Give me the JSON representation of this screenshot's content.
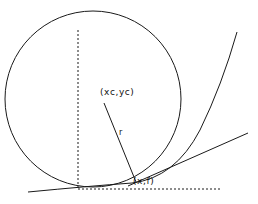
{
  "figure": {
    "type": "geometry-diagram",
    "background_color": "#ffffff",
    "stroke_color": "#1a1a1a",
    "labels": {
      "center_point": "(xc,yc)",
      "tangent_point": "(x,f)",
      "radius": "r"
    },
    "geometry": {
      "circle": {
        "center_x": 93,
        "center_y": 99,
        "radius": 88,
        "style": "solid"
      },
      "vertical_dashed_line": {
        "x": 78,
        "y_start": 30,
        "y_end": 188,
        "style": "dashed"
      },
      "horizontal_dashed_line": {
        "y": 189,
        "x_start": 78,
        "x_end": 222,
        "style": "dashed"
      },
      "radius_line": {
        "x1": 104,
        "y1": 103,
        "x2": 136,
        "y2": 182,
        "style": "solid"
      },
      "curve": {
        "shape": "parabola",
        "x_start": 28,
        "y_start": 192,
        "x_end": 237,
        "y_end": 32,
        "style": "solid"
      },
      "tangent_line": {
        "x1": 128,
        "y1": 186,
        "x2": 248,
        "y2": 133,
        "style": "solid"
      }
    }
  }
}
